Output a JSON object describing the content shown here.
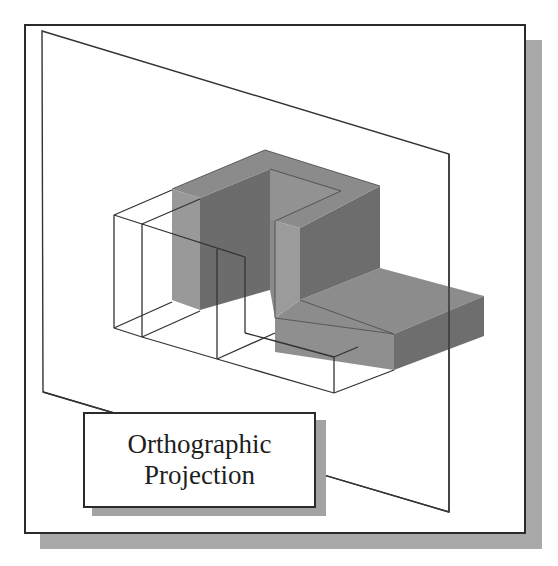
{
  "figure": {
    "caption_box": {
      "line1": "Orthographic",
      "line2": "Projection"
    },
    "colors": {
      "frame_border": "#2b2b2b",
      "frame_shadow": "#a9a9a9",
      "plane_edge": "#333333",
      "solid_top": "#8a8a8a",
      "solid_light_face": "#9a9a9a",
      "solid_dark_face": "#6f6f6f",
      "wireframe": "#333333",
      "background": "#ffffff"
    },
    "elements": [
      {
        "name": "projection-plane",
        "type": "parallelogram"
      },
      {
        "name": "shaded-3d-solid",
        "type": "isometric-solid"
      },
      {
        "name": "projected-wireframe-outline",
        "type": "wireframe"
      },
      {
        "name": "caption-box",
        "type": "label"
      }
    ]
  }
}
